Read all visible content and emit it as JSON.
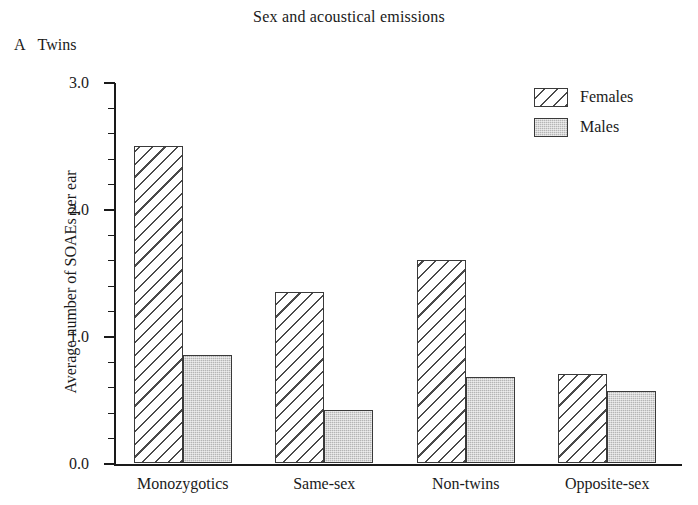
{
  "chart_data": {
    "type": "bar",
    "title": "Sex and acoustical emissions",
    "panel": {
      "letter": "A",
      "label": "Twins"
    },
    "xlabel": "",
    "ylabel": "Average number of SOAEs per ear",
    "ylim": [
      0.0,
      3.0
    ],
    "ytick_labels": [
      "0.0",
      "1.0",
      "2.0",
      "3.0"
    ],
    "ytick_values": [
      0.0,
      1.0,
      2.0,
      3.0
    ],
    "minor_tick_step": 0.2,
    "grid": false,
    "legend_position": "top-right",
    "categories": [
      "Monozygotics",
      "Same-sex",
      "Non-twins",
      "Opposite-sex"
    ],
    "series": [
      {
        "name": "Females",
        "fill": "diagonal-hatch",
        "values": [
          2.5,
          1.35,
          1.6,
          0.7
        ]
      },
      {
        "name": "Males",
        "fill": "gray-stipple",
        "values": [
          0.85,
          0.42,
          0.68,
          0.57
        ]
      }
    ]
  },
  "legend": {
    "entries": [
      {
        "label": "Females"
      },
      {
        "label": "Males"
      }
    ]
  },
  "colors": {
    "axis": "#1a1a1a",
    "hatch": "#4a4a4a",
    "males_fill": "#b5b5b5",
    "background": "#ffffff"
  }
}
